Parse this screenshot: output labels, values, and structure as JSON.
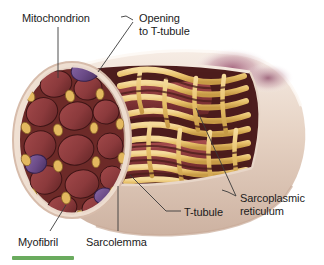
{
  "figure": {
    "background_color": "#ffffff",
    "accent_bar_color": "#6aab5e"
  },
  "labels": [
    {
      "id": "mitochondrion",
      "text": "Mitochondrion",
      "x": 22,
      "y": 12,
      "align": "left"
    },
    {
      "id": "opening-to-t-tubule",
      "text": "Opening\nto T-tubule",
      "x": 139,
      "y": 12,
      "align": "left"
    },
    {
      "id": "sarcoplasmic-reticulum",
      "text": "Sarcoplasmic\nreticulum",
      "x": 240,
      "y": 192,
      "align": "left"
    },
    {
      "id": "t-tubule",
      "text": "T-tubule",
      "x": 184,
      "y": 206,
      "align": "left"
    },
    {
      "id": "sarcolemma",
      "text": "Sarcolemma",
      "x": 86,
      "y": 236,
      "align": "left"
    },
    {
      "id": "myofibril",
      "text": "Myofibril",
      "x": 18,
      "y": 236,
      "align": "left"
    }
  ],
  "structures": {
    "sarcolemma_color": "#e4cfc0",
    "sarcolemma_highlight": "#f3e6dc",
    "myofibril_color": "#8e3a3c",
    "myofibril_dark": "#5d2225",
    "mitochondrion_color": "#6a4a86",
    "sarcoplasmic_reticulum_color": "#e9c26a",
    "sarcoplasmic_reticulum_shadow": "#4e2b1e",
    "interior_color": "#53201f",
    "blush_color": "#a4617f"
  },
  "colors": {
    "label_text": "#1b1b1b",
    "leader_line": "#3a3a3a"
  }
}
